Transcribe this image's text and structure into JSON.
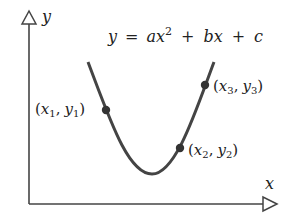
{
  "diagram": {
    "type": "parabola-through-three-points",
    "axes": {
      "x_label": "x",
      "y_label": "y"
    },
    "equation": {
      "lhs": "y",
      "eq": "=",
      "term1_coef": "a",
      "term1_var": "x",
      "term1_exp": "2",
      "plus1": "+",
      "term2": "bx",
      "plus2": "+",
      "term3": "c"
    },
    "points": [
      {
        "label_open": "(",
        "x": "x",
        "xsub": "1",
        "comma": ",",
        "y": "y",
        "ysub": "1",
        "label_close": ")"
      },
      {
        "label_open": "(",
        "x": "x",
        "xsub": "2",
        "comma": ",",
        "y": "y",
        "ysub": "2",
        "label_close": ")"
      },
      {
        "label_open": "(",
        "x": "x",
        "xsub": "3",
        "comma": ",",
        "y": "y",
        "ysub": "3",
        "label_close": ")"
      }
    ],
    "colors": {
      "stroke": "#444444",
      "background": "#ffffff"
    }
  }
}
